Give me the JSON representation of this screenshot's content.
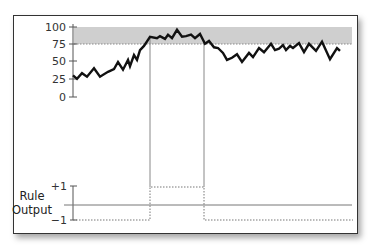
{
  "chart_data": [
    {
      "type": "line",
      "title": "",
      "xlabel": "",
      "ylabel": "",
      "ylim": [
        0,
        100
      ],
      "yticks": [
        "0",
        "25",
        "50",
        "75",
        "100"
      ],
      "threshold_band": {
        "from": 75,
        "to": 100,
        "color": "#c8c8c8"
      },
      "series": [
        {
          "name": "signal",
          "color": "#111111",
          "x": [
            0,
            4,
            9,
            14,
            21,
            27,
            35,
            41,
            45,
            50,
            55,
            57,
            61,
            64,
            67,
            71,
            77,
            84,
            87,
            92,
            95,
            99,
            104,
            109,
            113,
            118,
            122,
            127,
            132,
            136,
            141,
            145,
            150,
            154,
            159,
            164,
            169,
            176,
            180,
            186,
            191,
            198,
            202,
            206,
            210,
            213,
            217,
            220,
            226,
            231,
            236,
            243,
            249,
            257,
            264,
            267
          ],
          "values": [
            31,
            26,
            34,
            29,
            41,
            29,
            36,
            40,
            50,
            39,
            53,
            44,
            60,
            53,
            67,
            73,
            86,
            84,
            87,
            83,
            89,
            84,
            96,
            86,
            87,
            89,
            84,
            90,
            76,
            80,
            71,
            70,
            63,
            53,
            56,
            61,
            50,
            63,
            57,
            70,
            64,
            76,
            67,
            69,
            74,
            67,
            73,
            70,
            77,
            64,
            76,
            66,
            79,
            54,
            70,
            66
          ]
        }
      ]
    },
    {
      "type": "line",
      "title": "",
      "ylabel": "Rule Output",
      "ylim": [
        -1,
        1
      ],
      "yticks": [
        "−1",
        "+1"
      ],
      "series": [
        {
          "name": "rule-output",
          "style": "dotted step",
          "segments": [
            {
              "x_from": 0,
              "x_to": 77,
              "value": -1
            },
            {
              "x_from": 77,
              "x_to": 131,
              "value": 1
            },
            {
              "x_from": 131,
              "x_to": 280,
              "value": -1
            }
          ]
        }
      ]
    }
  ],
  "labels": {
    "y100": "100",
    "y75": "75",
    "y50": "50",
    "y25": "25",
    "y0": "0",
    "rule_line1": "Rule",
    "rule_line2": "Output",
    "plus_one": "+1",
    "minus_one": "−1"
  }
}
